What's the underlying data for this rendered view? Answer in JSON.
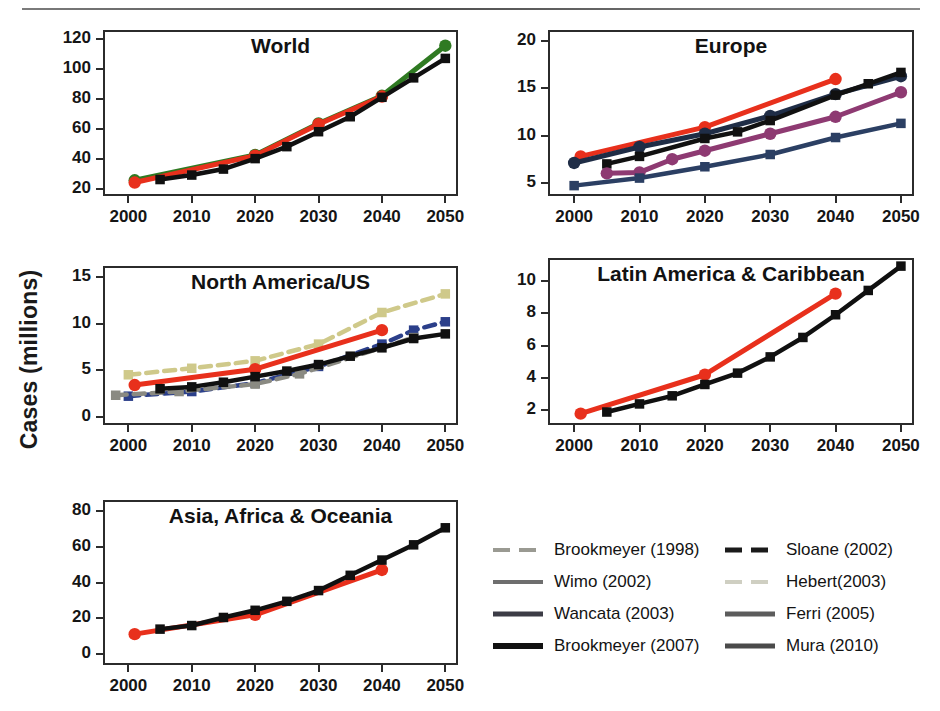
{
  "figure": {
    "ylabel": "Cases (millions)"
  },
  "legend": {
    "columns": [
      {
        "entries": [
          {
            "label": "Brookmeyer (1998)",
            "color": "#9a9a92",
            "dash": "dashed",
            "width": 4
          },
          {
            "label": "Wimo (2002)",
            "color": "#6e6e6e",
            "dash": "solid",
            "width": 4
          },
          {
            "label": "Wancata (2003)",
            "color": "#3c3c46",
            "dash": "solid",
            "width": 5
          },
          {
            "label": "Brookmeyer (2007)",
            "color": "#111111",
            "dash": "solid",
            "width": 6
          }
        ]
      },
      {
        "entries": [
          {
            "label": "Sloane (2002)",
            "color": "#1a1a1a",
            "dash": "dashed",
            "width": 5
          },
          {
            "label": "Hebert(2003)",
            "color": "#cfcfc2",
            "dash": "dashed",
            "width": 4
          },
          {
            "label": "Ferri (2005)",
            "color": "#5c5c5c",
            "dash": "solid",
            "width": 5
          },
          {
            "label": "Mura (2010)",
            "color": "#4a4a4a",
            "dash": "solid",
            "width": 5
          }
        ]
      }
    ]
  },
  "chart_data": [
    {
      "id": "world",
      "type": "line",
      "title": "World",
      "xlabel": "",
      "ylabel": "Cases (millions)",
      "xlim": [
        1996,
        2052
      ],
      "ylim": [
        15,
        126
      ],
      "xticks": [
        2000,
        2010,
        2020,
        2030,
        2040,
        2050
      ],
      "yticks": [
        20,
        40,
        60,
        80,
        100,
        120
      ],
      "grid": false,
      "series": [
        {
          "name": "Wimo (2002)",
          "color": "#2f7a22",
          "dash": "solid",
          "marker": "circle",
          "x": [
            2001,
            2020,
            2030,
            2040,
            2050
          ],
          "values": [
            25.5,
            42.5,
            63.5,
            82.0,
            115.5
          ]
        },
        {
          "name": "Ferri (2005)",
          "color": "#e8301c",
          "dash": "solid",
          "marker": "circle",
          "x": [
            2001,
            2020,
            2030,
            2040
          ],
          "values": [
            24.0,
            42.0,
            63.0,
            81.5
          ]
        },
        {
          "name": "Brookmeyer (2007)",
          "color": "#101010",
          "dash": "solid",
          "marker": "square",
          "x": [
            2005,
            2010,
            2015,
            2020,
            2025,
            2030,
            2035,
            2040,
            2045,
            2050
          ],
          "values": [
            26.0,
            29.0,
            33.0,
            40.0,
            48.0,
            58.0,
            68.0,
            81.0,
            94.0,
            107.0
          ]
        }
      ]
    },
    {
      "id": "europe",
      "type": "line",
      "title": "Europe",
      "xlabel": "",
      "ylabel": "Cases (millions)",
      "xlim": [
        1996,
        2052
      ],
      "ylim": [
        3.6,
        21.2
      ],
      "xticks": [
        2000,
        2010,
        2020,
        2030,
        2040,
        2050
      ],
      "yticks": [
        5,
        10,
        15,
        20
      ],
      "grid": false,
      "series": [
        {
          "name": "Ferri (2005)",
          "color": "#e8301c",
          "dash": "solid",
          "marker": "circle",
          "x": [
            2001,
            2020,
            2040
          ],
          "values": [
            7.8,
            10.9,
            16.0
          ]
        },
        {
          "name": "Wancata (2003)",
          "color": "#1f2d46",
          "dash": "solid",
          "marker": "circle",
          "x": [
            2000,
            2010,
            2020,
            2030,
            2040,
            2050
          ],
          "values": [
            7.1,
            8.8,
            10.2,
            12.1,
            14.4,
            16.3
          ]
        },
        {
          "name": "Sloane (2002)",
          "color": "#111111",
          "dash": "solid",
          "marker": "square",
          "x": [
            2005,
            2010,
            2020,
            2025,
            2030,
            2040,
            2045,
            2050
          ],
          "values": [
            7.0,
            7.8,
            9.7,
            10.4,
            11.6,
            14.3,
            15.5,
            16.7
          ]
        },
        {
          "name": "Mura (2010)",
          "color": "#8e3a72",
          "dash": "solid",
          "marker": "circle",
          "x": [
            2005,
            2010,
            2015,
            2020,
            2030,
            2040,
            2050
          ],
          "values": [
            6.0,
            6.1,
            7.5,
            8.4,
            10.2,
            12.0,
            14.6
          ]
        },
        {
          "name": "Wimo (2002)",
          "color": "#2b3f63",
          "dash": "solid",
          "marker": "square",
          "x": [
            2000,
            2010,
            2020,
            2030,
            2040,
            2050
          ],
          "values": [
            4.7,
            5.5,
            6.7,
            8.0,
            9.8,
            11.3
          ]
        }
      ]
    },
    {
      "id": "north-america",
      "type": "line",
      "title": "North America/US",
      "xlabel": "",
      "ylabel": "Cases (millions)",
      "xlim": [
        1996,
        2052
      ],
      "ylim": [
        -0.9,
        16.2
      ],
      "xticks": [
        2000,
        2010,
        2020,
        2030,
        2040,
        2050
      ],
      "yticks": [
        0,
        5,
        10,
        15
      ],
      "grid": false,
      "series": [
        {
          "name": "Hebert(2003)",
          "color": "#cfc98a",
          "dash": "dashed",
          "marker": "square",
          "x": [
            2000,
            2010,
            2020,
            2030,
            2040,
            2050
          ],
          "values": [
            4.5,
            5.2,
            6.0,
            7.8,
            11.2,
            13.2
          ]
        },
        {
          "name": "Ferri (2005)",
          "color": "#e8301c",
          "dash": "solid",
          "marker": "circle",
          "x": [
            2001,
            2020,
            2040
          ],
          "values": [
            3.4,
            5.1,
            9.3
          ]
        },
        {
          "name": "Sloane (2002)",
          "color": "#2b3f8a",
          "dash": "dashed",
          "marker": "square",
          "x": [
            2000,
            2010,
            2020,
            2030,
            2040,
            2045,
            2050
          ],
          "values": [
            2.2,
            2.7,
            3.6,
            5.4,
            7.8,
            9.3,
            10.2
          ]
        },
        {
          "name": "Brookmeyer (1998)",
          "color": "#8a8a82",
          "dash": "dashed",
          "marker": "square",
          "x": [
            1998,
            2008,
            2020,
            2027,
            2045
          ],
          "values": [
            2.3,
            2.7,
            3.5,
            4.6,
            8.5
          ]
        },
        {
          "name": "Brookmeyer (2007)",
          "color": "#101010",
          "dash": "solid",
          "marker": "square",
          "x": [
            2005,
            2010,
            2015,
            2020,
            2025,
            2030,
            2035,
            2040,
            2045,
            2050
          ],
          "values": [
            3.0,
            3.2,
            3.7,
            4.3,
            4.9,
            5.6,
            6.5,
            7.4,
            8.4,
            8.9
          ]
        }
      ]
    },
    {
      "id": "latin-america",
      "type": "line",
      "title": "Latin America & Caribbean",
      "xlabel": "",
      "ylabel": "Cases (millions)",
      "xlim": [
        1996,
        2052
      ],
      "ylim": [
        1.1,
        11.4
      ],
      "xticks": [
        2000,
        2010,
        2020,
        2030,
        2040,
        2050
      ],
      "yticks": [
        2,
        4,
        6,
        8,
        10
      ],
      "grid": false,
      "series": [
        {
          "name": "Ferri (2005)",
          "color": "#e8301c",
          "dash": "solid",
          "marker": "circle",
          "x": [
            2001,
            2020,
            2040
          ],
          "values": [
            1.8,
            4.2,
            9.2
          ]
        },
        {
          "name": "Brookmeyer (2007)",
          "color": "#101010",
          "dash": "solid",
          "marker": "square",
          "x": [
            2005,
            2010,
            2015,
            2020,
            2025,
            2030,
            2035,
            2040,
            2045,
            2050
          ],
          "values": [
            1.9,
            2.4,
            2.9,
            3.6,
            4.3,
            5.3,
            6.5,
            7.9,
            9.4,
            10.9
          ]
        }
      ]
    },
    {
      "id": "asia-africa-oceania",
      "type": "line",
      "title": "Asia, Africa & Oceania",
      "xlabel": "",
      "ylabel": "Cases (millions)",
      "xlim": [
        1996,
        2052
      ],
      "ylim": [
        -6,
        86
      ],
      "xticks": [
        2000,
        2010,
        2020,
        2030,
        2040,
        2050
      ],
      "yticks": [
        0,
        20,
        40,
        60,
        80
      ],
      "grid": false,
      "series": [
        {
          "name": "Ferri (2005)",
          "color": "#e8301c",
          "dash": "solid",
          "marker": "circle",
          "x": [
            2001,
            2020,
            2040
          ],
          "values": [
            11.2,
            22.0,
            47.0
          ]
        },
        {
          "name": "Brookmeyer (2007)",
          "color": "#101010",
          "dash": "solid",
          "marker": "square",
          "x": [
            2005,
            2010,
            2015,
            2020,
            2025,
            2030,
            2035,
            2040,
            2045,
            2050
          ],
          "values": [
            14.0,
            16.0,
            20.5,
            24.5,
            29.5,
            35.5,
            44.0,
            52.5,
            61.0,
            70.5
          ]
        }
      ]
    }
  ]
}
